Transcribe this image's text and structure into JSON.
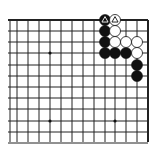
{
  "diagram": {
    "type": "go-board-fragment",
    "corner": "top-right",
    "grid": {
      "columns_x": [
        10,
        17,
        28,
        39,
        50,
        61,
        72,
        83,
        94,
        105,
        115,
        126,
        137,
        148
      ],
      "rows_y": [
        20,
        31,
        42,
        53,
        65,
        76,
        87,
        98,
        109,
        121,
        132,
        143
      ],
      "left_x": 8,
      "right_x": 148,
      "top_y": 20,
      "bottom_y": 142,
      "line_color": "#222222",
      "edge_width": 2
    },
    "star_points": [
      {
        "x": 50,
        "y": 53
      },
      {
        "x": 50,
        "y": 121
      },
      {
        "x": 115,
        "y": 121
      }
    ],
    "stones": [
      {
        "color": "black",
        "x": 105,
        "y": 20,
        "mark": "triangle"
      },
      {
        "color": "black",
        "x": 105,
        "y": 31
      },
      {
        "color": "black",
        "x": 105,
        "y": 42
      },
      {
        "color": "black",
        "x": 105,
        "y": 53
      },
      {
        "color": "black",
        "x": 115,
        "y": 53
      },
      {
        "color": "black",
        "x": 126,
        "y": 53
      },
      {
        "color": "black",
        "x": 137,
        "y": 65
      },
      {
        "color": "black",
        "x": 137,
        "y": 76
      },
      {
        "color": "white",
        "x": 115,
        "y": 20,
        "mark": "triangle"
      },
      {
        "color": "white",
        "x": 115,
        "y": 31
      },
      {
        "color": "white",
        "x": 115,
        "y": 42
      },
      {
        "color": "white",
        "x": 126,
        "y": 42
      },
      {
        "color": "white",
        "x": 137,
        "y": 42
      },
      {
        "color": "white",
        "x": 137,
        "y": 53
      }
    ],
    "stone_radius": 5.5
  }
}
